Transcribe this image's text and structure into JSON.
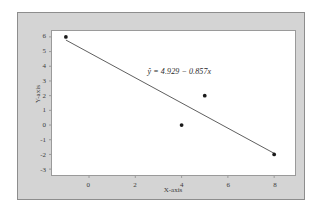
{
  "chart_data": {
    "type": "scatter",
    "title": "",
    "subtitle": "",
    "xlabel": "X-axis",
    "ylabel": "Y-axis",
    "xlim": [
      -1.6,
      8.9
    ],
    "ylim": [
      -3.4,
      6.4
    ],
    "xticks": [
      0,
      2,
      4,
      6,
      8
    ],
    "xtick_labels": [
      "0",
      "2",
      "4",
      "6",
      "8"
    ],
    "yticks": [
      6,
      5,
      4,
      3,
      2,
      1,
      0,
      -1,
      -2,
      -3
    ],
    "ytick_labels": [
      "6",
      "5",
      "4",
      "3",
      "2",
      "1",
      "0",
      "-1",
      "-2",
      "-3"
    ],
    "grid": false,
    "legend": false,
    "points": [
      {
        "x": -1,
        "y": 6
      },
      {
        "x": 4,
        "y": 0
      },
      {
        "x": 5,
        "y": 2
      },
      {
        "x": 8,
        "y": -2
      }
    ],
    "series": [
      {
        "name": "data points",
        "type": "scatter",
        "marker": "filled-circle",
        "color": "#1a1a1a",
        "x": [
          -1,
          4,
          5,
          8
        ],
        "y": [
          6,
          0,
          2,
          -2
        ]
      },
      {
        "name": "fitted regression line",
        "type": "line",
        "color": "#4a4a4a",
        "intercept": 4.929,
        "slope": -0.857,
        "x": [
          -1,
          8
        ],
        "y": [
          5.786,
          -1.927
        ]
      }
    ],
    "annotations": [
      {
        "name": "regression-equation",
        "text": "ŷ = 4.929 − 0.857x",
        "x": 3.9,
        "y": 3.55
      }
    ]
  },
  "axes": {
    "x_title": "X-axis",
    "y_title": "Y-axis"
  },
  "equation": {
    "text": "ŷ = 4.929 − 0.857x"
  },
  "colors": {
    "page_background": "#ffffff",
    "panel_background": "#d4d4d4",
    "panel_border": "#8d8d8d",
    "plot_background": "#ffffff",
    "plot_border": "#9a9a9a",
    "marker": "#1a1a1a",
    "line": "#4a4a4a",
    "text": "#3b3b3b"
  }
}
